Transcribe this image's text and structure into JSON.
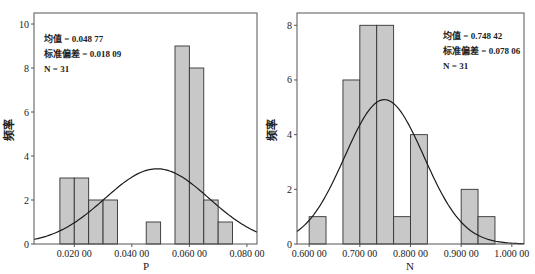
{
  "chart_data": [
    {
      "type": "bar",
      "subtype": "histogram_with_normal_curve",
      "title": "",
      "xlabel": "P",
      "ylabel": "频率",
      "xlim": [
        0.006,
        0.0835
      ],
      "ylim": [
        0,
        10.5
      ],
      "xticks": [
        0.02,
        0.04,
        0.06,
        0.08
      ],
      "xtick_labels": [
        "0.020 00",
        "0.040 00",
        "0.060 00",
        "0.080 00"
      ],
      "yticks": [
        0,
        2,
        4,
        6,
        8,
        10
      ],
      "ytick_labels": [
        "0",
        "2",
        "4",
        "6",
        "8",
        "10"
      ],
      "bins": [
        {
          "start": 0.015,
          "end": 0.02,
          "count": 3
        },
        {
          "start": 0.02,
          "end": 0.025,
          "count": 3
        },
        {
          "start": 0.025,
          "end": 0.03,
          "count": 2
        },
        {
          "start": 0.03,
          "end": 0.035,
          "count": 2
        },
        {
          "start": 0.045,
          "end": 0.05,
          "count": 1
        },
        {
          "start": 0.055,
          "end": 0.06,
          "count": 9
        },
        {
          "start": 0.06,
          "end": 0.065,
          "count": 8
        },
        {
          "start": 0.065,
          "end": 0.07,
          "count": 2
        },
        {
          "start": 0.07,
          "end": 0.075,
          "count": 1
        }
      ],
      "normal_curve": {
        "mean": 0.04877,
        "sd": 0.01809,
        "n": 31,
        "bin_width": 0.005
      },
      "annotations": [
        "均值 = 0.048 77",
        "标准偏差 = 0.018 09",
        "N = 31"
      ],
      "legend": null,
      "grid": false
    },
    {
      "type": "bar",
      "subtype": "histogram_with_normal_curve",
      "title": "",
      "xlabel": "N",
      "ylabel": "频率",
      "xlim": [
        0.576,
        1.024
      ],
      "ylim": [
        0,
        8.45
      ],
      "xticks": [
        0.6,
        0.7,
        0.8,
        0.9,
        1.0
      ],
      "xtick_labels": [
        "0.600 00",
        "0.700 00",
        "0.800 00",
        "0.900 00",
        "1.000 00"
      ],
      "yticks": [
        0,
        2,
        4,
        6,
        8
      ],
      "ytick_labels": [
        "0",
        "2",
        "4",
        "6",
        "8"
      ],
      "bins": [
        {
          "start": 0.6,
          "end": 0.6333,
          "count": 1
        },
        {
          "start": 0.6667,
          "end": 0.7,
          "count": 6
        },
        {
          "start": 0.7,
          "end": 0.7333,
          "count": 8
        },
        {
          "start": 0.7333,
          "end": 0.7667,
          "count": 8
        },
        {
          "start": 0.7667,
          "end": 0.8,
          "count": 1
        },
        {
          "start": 0.8,
          "end": 0.8333,
          "count": 4
        },
        {
          "start": 0.9,
          "end": 0.9333,
          "count": 2
        },
        {
          "start": 0.9333,
          "end": 0.9667,
          "count": 1
        }
      ],
      "normal_curve": {
        "mean": 0.74842,
        "sd": 0.07806,
        "n": 31,
        "bin_width": 0.03333
      },
      "annotations": [
        "均值 = 0.748 42",
        "标准偏差 = 0.078 06",
        "N = 31"
      ],
      "legend": null,
      "grid": false
    }
  ],
  "charts": [
    {
      "stats": {
        "mean": "均值 = 0.048 77",
        "sd": "标准偏差 = 0.018 09",
        "n": "N = 31"
      },
      "xlabel": "P",
      "ylabel": "频率"
    },
    {
      "stats": {
        "mean": "均值 = 0.748 42",
        "sd": "标准偏差 = 0.078 06",
        "n": "N = 31"
      },
      "xlabel": "N",
      "ylabel": "频率"
    }
  ],
  "colors": {
    "bar_fill": "#c8c8c8",
    "bar_stroke": "#333333",
    "curve": "#1a1a1a",
    "frame": "#555555"
  }
}
